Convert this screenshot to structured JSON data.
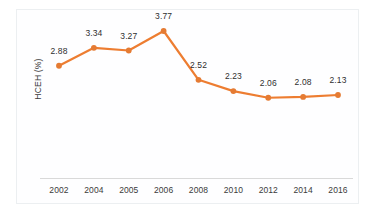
{
  "chart_data": {
    "type": "line",
    "title": "",
    "xlabel": "",
    "ylabel": "HCEH (%)",
    "categories": [
      "2002",
      "2004",
      "2005",
      "2006",
      "2008",
      "2010",
      "2012",
      "2014",
      "2016"
    ],
    "values": [
      2.88,
      3.34,
      3.27,
      3.77,
      2.52,
      2.23,
      2.06,
      2.08,
      2.13
    ],
    "data_labels": [
      "2.88",
      "3.34",
      "3.27",
      "3.77",
      "2.52",
      "2.23",
      "2.06",
      "2.08",
      "2.13"
    ],
    "series": [
      {
        "name": "HCEH (%)",
        "values": [
          2.88,
          3.34,
          3.27,
          3.77,
          2.52,
          2.23,
          2.06,
          2.08,
          2.13
        ]
      }
    ],
    "ylim": [
      1.55,
      4.05
    ],
    "grid": false,
    "legend": "none",
    "y_tick_labels": [],
    "colors": {
      "line": "#ED7D31",
      "marker": "#E57B33",
      "axis": "#d9d9d9",
      "border": "#eceff1",
      "label_text": "#2f2f2f",
      "background": "#ffffff"
    }
  },
  "axis": {
    "y_title": "HCEH (%)"
  }
}
